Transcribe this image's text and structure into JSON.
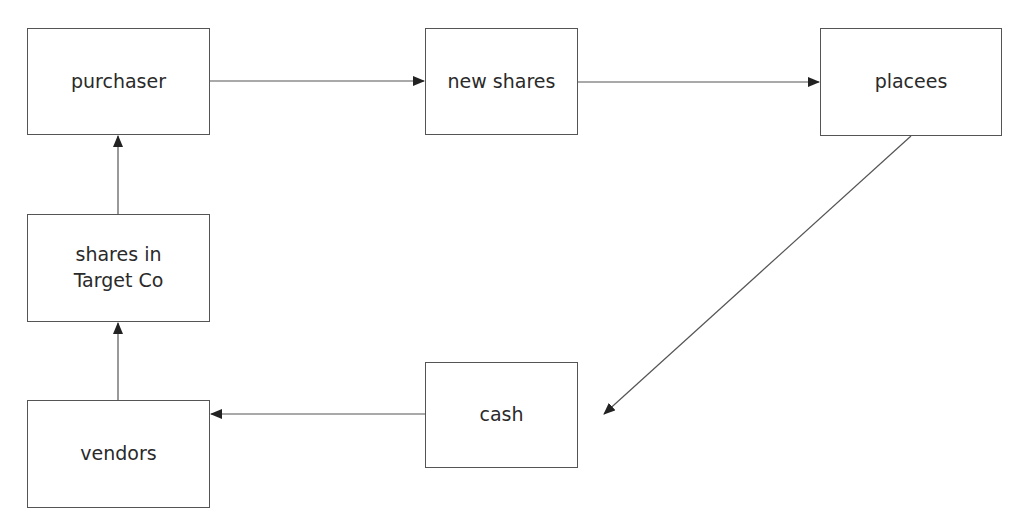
{
  "diagram": {
    "nodes": [
      {
        "id": "purchaser",
        "label": "purchaser",
        "x": 27,
        "y": 28,
        "w": 183,
        "h": 107
      },
      {
        "id": "new_shares",
        "label": "new shares",
        "x": 425,
        "y": 28,
        "w": 153,
        "h": 107
      },
      {
        "id": "placees",
        "label": "placees",
        "x": 820,
        "y": 28,
        "w": 182,
        "h": 108
      },
      {
        "id": "shares_target",
        "label": "shares in\nTarget Co",
        "x": 27,
        "y": 214,
        "w": 183,
        "h": 108
      },
      {
        "id": "vendors",
        "label": "vendors",
        "x": 27,
        "y": 400,
        "w": 183,
        "h": 108
      },
      {
        "id": "cash",
        "label": "cash",
        "x": 425,
        "y": 362,
        "w": 153,
        "h": 106
      }
    ],
    "edges": [
      {
        "from": "purchaser",
        "to": "new_shares"
      },
      {
        "from": "new_shares",
        "to": "placees"
      },
      {
        "from": "placees",
        "to": "cash"
      },
      {
        "from": "cash",
        "to": "vendors"
      },
      {
        "from": "vendors",
        "to": "shares_target"
      },
      {
        "from": "shares_target",
        "to": "purchaser"
      }
    ],
    "colors": {
      "line": "#555555",
      "arrowhead": "#222222",
      "text": "#2a2a2a"
    }
  }
}
